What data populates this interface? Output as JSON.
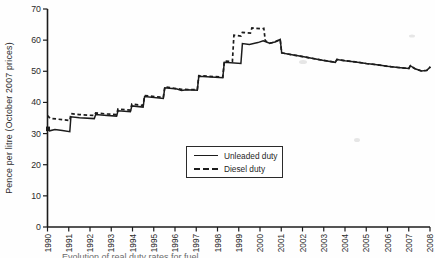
{
  "figure": {
    "background": "#fefefe",
    "ink": "#1c1c1c",
    "caption_partial": "Evolution of real duty rates for fuel"
  },
  "chart_data": {
    "type": "line",
    "title": "",
    "xlabel": "",
    "ylabel": "Pence per litre (October 2007 prices)",
    "ylim": [
      0,
      70
    ],
    "xlim": [
      1990,
      2008
    ],
    "yticks": [
      0,
      10,
      20,
      30,
      40,
      50,
      60,
      70
    ],
    "xticks": [
      1990,
      1991,
      1992,
      1993,
      1994,
      1995,
      1996,
      1997,
      1998,
      1999,
      2000,
      2001,
      2002,
      2003,
      2004,
      2005,
      2006,
      2007,
      2008
    ],
    "grid": "off",
    "legend": {
      "position": "center",
      "entries": [
        {
          "label": "Unleaded duty",
          "style": "solid"
        },
        {
          "label": "Diesel duty",
          "style": "dashed"
        }
      ]
    },
    "series": [
      {
        "name": "Unleaded duty",
        "style": "solid",
        "points": [
          [
            1990,
            31.6
          ],
          [
            1990.1,
            30.9
          ],
          [
            1990.35,
            31.3
          ],
          [
            1990.7,
            31.0
          ],
          [
            1991.05,
            30.6
          ],
          [
            1991.1,
            35.4
          ],
          [
            1991.5,
            35.1
          ],
          [
            1992.2,
            34.8
          ],
          [
            1992.27,
            36.1
          ],
          [
            1992.8,
            35.8
          ],
          [
            1993.25,
            35.6
          ],
          [
            1993.32,
            37.3
          ],
          [
            1993.9,
            37.0
          ],
          [
            1993.97,
            38.9
          ],
          [
            1994.5,
            38.5
          ],
          [
            1994.57,
            41.9
          ],
          [
            1995.45,
            41.3
          ],
          [
            1995.52,
            44.7
          ],
          [
            1996.1,
            44.3
          ],
          [
            1996.3,
            43.8
          ],
          [
            1996.55,
            44.1
          ],
          [
            1997.05,
            43.9
          ],
          [
            1997.12,
            48.4
          ],
          [
            1997.7,
            48.2
          ],
          [
            1998.25,
            47.9
          ],
          [
            1998.32,
            52.9
          ],
          [
            1999.1,
            52.5
          ],
          [
            1999.17,
            58.9
          ],
          [
            1999.5,
            58.6
          ],
          [
            1999.9,
            59.2
          ],
          [
            2000.15,
            59.8
          ],
          [
            2000.45,
            59.0
          ],
          [
            2000.7,
            59.4
          ],
          [
            2000.95,
            60.2
          ],
          [
            2001.02,
            55.9
          ],
          [
            2001.5,
            55.3
          ],
          [
            2002,
            54.7
          ],
          [
            2002.5,
            54.1
          ],
          [
            2003,
            53.5
          ],
          [
            2003.55,
            52.9
          ],
          [
            2003.62,
            53.8
          ],
          [
            2004,
            53.4
          ],
          [
            2004.5,
            53.0
          ],
          [
            2005,
            52.5
          ],
          [
            2005.5,
            52.1
          ],
          [
            2006,
            51.6
          ],
          [
            2006.5,
            51.2
          ],
          [
            2007,
            50.9
          ],
          [
            2007.08,
            51.8
          ],
          [
            2007.3,
            50.8
          ],
          [
            2007.6,
            50.1
          ],
          [
            2007.85,
            50.3
          ],
          [
            2008.02,
            51.4
          ]
        ]
      },
      {
        "name": "Diesel duty",
        "style": "dashed",
        "points": [
          [
            1990,
            35.8
          ],
          [
            1990.12,
            34.9
          ],
          [
            1990.5,
            34.6
          ],
          [
            1991.05,
            34.2
          ],
          [
            1991.1,
            36.4
          ],
          [
            1991.5,
            36.1
          ],
          [
            1992.2,
            35.8
          ],
          [
            1992.27,
            36.6
          ],
          [
            1992.8,
            36.3
          ],
          [
            1993.25,
            36.1
          ],
          [
            1993.32,
            37.9
          ],
          [
            1993.9,
            37.5
          ],
          [
            1993.97,
            39.5
          ],
          [
            1994.5,
            39.0
          ],
          [
            1994.57,
            42.2
          ],
          [
            1995.45,
            41.6
          ],
          [
            1995.52,
            45.0
          ],
          [
            1996.3,
            44.2
          ],
          [
            1997.05,
            44.1
          ],
          [
            1997.12,
            48.6
          ],
          [
            1998.25,
            48.1
          ],
          [
            1998.32,
            53.3
          ],
          [
            1998.7,
            53.1
          ],
          [
            1998.77,
            61.6
          ],
          [
            1999.1,
            61.3
          ],
          [
            1999.17,
            62.5
          ],
          [
            1999.55,
            62.3
          ],
          [
            1999.62,
            63.9
          ],
          [
            2000.1,
            63.6
          ],
          [
            2000.18,
            63.8
          ],
          [
            2000.25,
            59.8
          ],
          [
            2000.45,
            59.0
          ],
          [
            2000.7,
            59.4
          ],
          [
            2000.95,
            60.2
          ],
          [
            2001.02,
            55.9
          ],
          [
            2001.5,
            55.3
          ],
          [
            2002,
            54.7
          ],
          [
            2002.5,
            54.1
          ],
          [
            2003,
            53.5
          ],
          [
            2003.55,
            52.9
          ],
          [
            2003.62,
            53.8
          ],
          [
            2004,
            53.4
          ],
          [
            2004.5,
            53.0
          ],
          [
            2005,
            52.5
          ],
          [
            2005.5,
            52.1
          ],
          [
            2006,
            51.6
          ],
          [
            2006.5,
            51.2
          ],
          [
            2007,
            50.9
          ],
          [
            2007.08,
            51.8
          ],
          [
            2007.3,
            50.8
          ],
          [
            2007.6,
            50.1
          ],
          [
            2007.85,
            50.3
          ],
          [
            2008.02,
            51.4
          ]
        ]
      }
    ]
  }
}
